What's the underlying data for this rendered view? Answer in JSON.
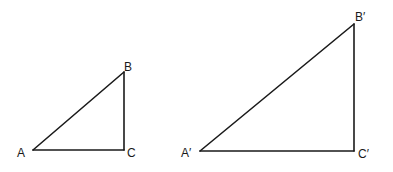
{
  "diagram": {
    "triangles": [
      {
        "id": "small",
        "vertices": {
          "A": {
            "label": "A",
            "x": 33,
            "y": 150
          },
          "B": {
            "label": "B",
            "x": 124,
            "y": 72
          },
          "C": {
            "label": "C",
            "x": 124,
            "y": 150
          }
        },
        "right_angle_at": "C"
      },
      {
        "id": "large",
        "vertices": {
          "A": {
            "label": "A′",
            "x": 200,
            "y": 151
          },
          "B": {
            "label": "B′",
            "x": 354,
            "y": 24
          },
          "C": {
            "label": "C′",
            "x": 354,
            "y": 151
          }
        },
        "right_angle_at": "C′"
      }
    ],
    "stroke_color": "#1a1a1a",
    "background": "#ffffff"
  },
  "labels": {
    "small_A": "A",
    "small_B": "B",
    "small_C": "C",
    "large_A": "A′",
    "large_B": "B′",
    "large_C": "C′"
  }
}
